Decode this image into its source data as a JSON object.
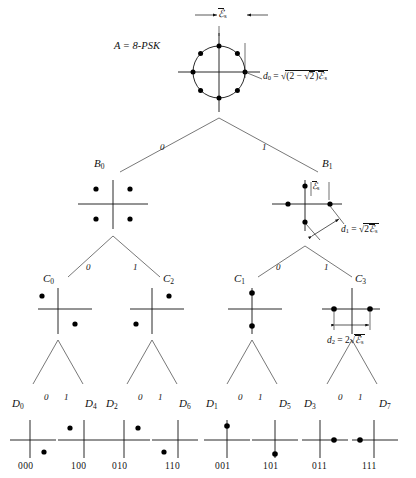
{
  "figure": {
    "type": "set-partitioning-tree",
    "title_label": "A = 8-PSK",
    "root": {
      "name": "A",
      "label": "A = 8-PSK",
      "constellation": "8-PSK",
      "points": 8,
      "distance_label": "d0 = sqrt((2 - sqrt2) Es)",
      "distance_tex": {
        "d": "d",
        "d_sub": "0",
        "eq": "=",
        "open": "(2 −",
        "inner_radicand": "2",
        "close": ")",
        "energy": "ℰ",
        "energy_sub": "s"
      },
      "energy_marker": {
        "symbol": "ℰ",
        "sub": "s",
        "overline": true
      }
    },
    "levels": [
      {
        "level": 1,
        "branch_labels": [
          "0",
          "1"
        ],
        "nodes": [
          {
            "name": "B0",
            "letter": "B",
            "sub": "0",
            "points": [
              {
                "x": -1,
                "y": 1
              },
              {
                "x": 1,
                "y": 1
              },
              {
                "x": -1,
                "y": -1
              },
              {
                "x": 1,
                "y": -1
              }
            ]
          },
          {
            "name": "B1",
            "letter": "B",
            "sub": "1",
            "points": [
              {
                "x": 0,
                "y": 1
              },
              {
                "x": 0,
                "y": -1
              },
              {
                "x": -1,
                "y": 0
              },
              {
                "x": 1,
                "y": 0
              }
            ],
            "distance_label": "d1 = sqrt(2 Es)",
            "distance_tex": {
              "d": "d",
              "d_sub": "1",
              "eq": "=",
              "radicand_coef": "2",
              "energy": "ℰ",
              "energy_sub": "s"
            },
            "energy_marker": {
              "symbol": "ℰ",
              "sub": "s",
              "overline": true
            }
          }
        ]
      },
      {
        "level": 2,
        "branch_labels": [
          "0",
          "1"
        ],
        "nodes": [
          {
            "name": "C0",
            "letter": "C",
            "sub": "0",
            "points": [
              {
                "x": -1,
                "y": 1
              },
              {
                "x": 1,
                "y": -1
              }
            ]
          },
          {
            "name": "C2",
            "letter": "C",
            "sub": "2",
            "points": [
              {
                "x": 1,
                "y": 1
              },
              {
                "x": -1,
                "y": -1
              }
            ]
          },
          {
            "name": "C1",
            "letter": "C",
            "sub": "1",
            "points": [
              {
                "x": 0,
                "y": 1
              },
              {
                "x": 0,
                "y": -1
              }
            ]
          },
          {
            "name": "C3",
            "letter": "C",
            "sub": "3",
            "points": [
              {
                "x": -1,
                "y": 0
              },
              {
                "x": 1,
                "y": 0
              }
            ],
            "distance_label": "d2 = 2 sqrt(Es)",
            "distance_tex": {
              "d": "d",
              "d_sub": "2",
              "eq": "=",
              "coef": "2",
              "energy": "ℰ",
              "energy_sub": "s"
            }
          }
        ]
      },
      {
        "level": 3,
        "branch_labels": [
          "0",
          "1"
        ],
        "nodes": [
          {
            "name": "D0",
            "letter": "D",
            "sub": "0",
            "code": "000",
            "points": [
              {
                "x": 1,
                "y": -1
              }
            ]
          },
          {
            "name": "D4",
            "letter": "D",
            "sub": "4",
            "code": "100",
            "points": [
              {
                "x": -1,
                "y": 1
              }
            ]
          },
          {
            "name": "D2",
            "letter": "D",
            "sub": "2",
            "code": "010",
            "points": [
              {
                "x": 1,
                "y": 1
              }
            ]
          },
          {
            "name": "D6",
            "letter": "D",
            "sub": "6",
            "code": "110",
            "points": [
              {
                "x": -1,
                "y": -1
              }
            ]
          },
          {
            "name": "D1",
            "letter": "D",
            "sub": "1",
            "code": "001",
            "points": [
              {
                "x": 0,
                "y": 1
              }
            ]
          },
          {
            "name": "D5",
            "letter": "D",
            "sub": "5",
            "code": "101",
            "points": [
              {
                "x": 0,
                "y": -1
              }
            ]
          },
          {
            "name": "D3",
            "letter": "D",
            "sub": "3",
            "code": "011",
            "points": [
              {
                "x": 1,
                "y": 0
              }
            ]
          },
          {
            "name": "D7",
            "letter": "D",
            "sub": "7",
            "code": "111",
            "points": [
              {
                "x": -1,
                "y": 0
              }
            ]
          }
        ]
      }
    ],
    "colors": {
      "ink": "#111111",
      "background": "#ffffff",
      "point": "#000000"
    }
  }
}
